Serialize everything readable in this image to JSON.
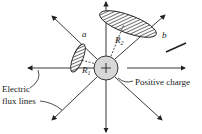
{
  "diagram": {
    "labels": {
      "a": "a",
      "b": "b",
      "r1": "R",
      "r1_sub": "1",
      "r2": "R",
      "r2_sub": "2",
      "positive_charge": "Positive charge",
      "electric_line1": "Electric",
      "electric_line2": "flux lines"
    },
    "colors": {
      "line": "#222222",
      "charge_fill": "#d8d8d8",
      "hatch": "#333333"
    }
  }
}
